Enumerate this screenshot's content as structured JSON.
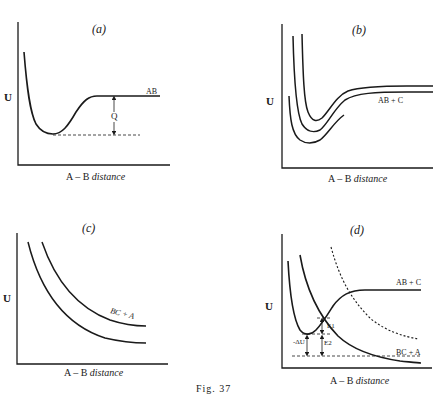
{
  "figure": {
    "caption": "Fig. 37",
    "panels": [
      {
        "id": "a",
        "label": "(a)",
        "ylabel": "U",
        "xlabel_prefix": "A – B",
        "xlabel_italic": "distance",
        "curve_labels": [
          "AB"
        ],
        "annotations": [
          "Q"
        ]
      },
      {
        "id": "b",
        "label": "(b)",
        "ylabel": "U",
        "xlabel_prefix": "A – B",
        "xlabel_italic": "distance",
        "curve_labels": [
          "AB + C"
        ],
        "annotations": []
      },
      {
        "id": "c",
        "label": "(c)",
        "ylabel": "U",
        "xlabel_prefix": "A – B",
        "xlabel_italic": "distance",
        "curve_labels": [
          "BC + A"
        ],
        "annotations": []
      },
      {
        "id": "d",
        "label": "(d)",
        "ylabel": "U",
        "xlabel_prefix": "A – B",
        "xlabel_italic": "distance",
        "curve_labels": [
          "AB + C",
          "BC + A"
        ],
        "annotations": [
          "-ΔU",
          "E1",
          "E2"
        ]
      }
    ]
  },
  "colors": {
    "ink": "#1a1a1a",
    "background": "#ffffff"
  }
}
